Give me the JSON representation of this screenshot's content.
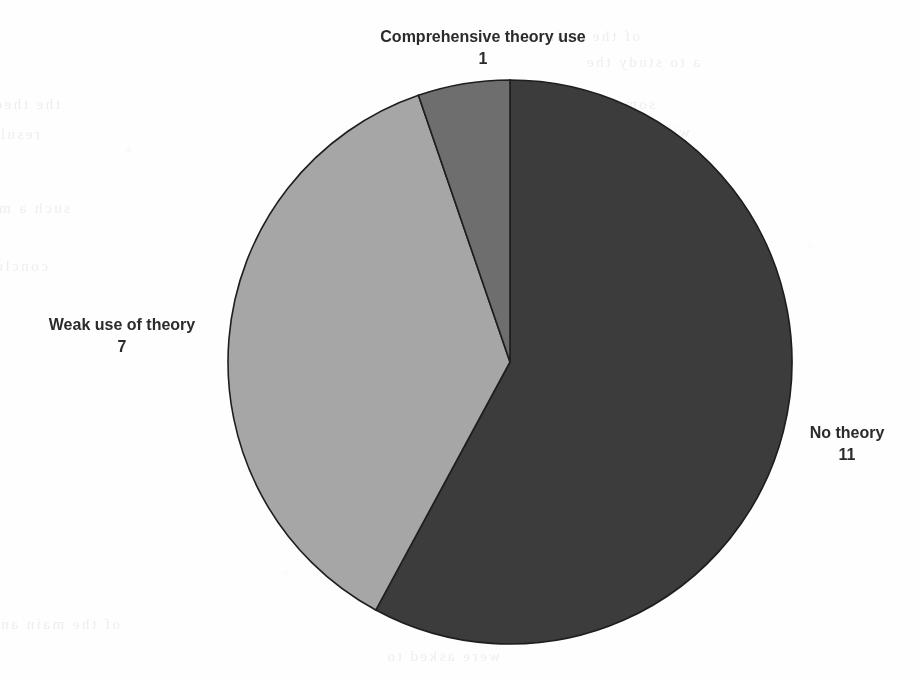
{
  "chart_data": {
    "type": "pie",
    "title": "",
    "categories": [
      "No theory",
      "Weak use of theory",
      "Comprehensive theory use"
    ],
    "values": [
      11,
      7,
      1
    ],
    "total": 19,
    "start_angle_deg": 0,
    "direction": "clockwise",
    "legend": "none",
    "grid": false,
    "data_labels": "category name and value, outside slices",
    "slices": [
      {
        "label": "No theory",
        "value": 11,
        "value_text": "11",
        "color": "#3c3c3c",
        "angle_deg": 208.4,
        "percent": 57.9
      },
      {
        "label": "Weak use of theory",
        "value": 7,
        "value_text": "7",
        "color": "#a6a6a6",
        "angle_deg": 132.6,
        "percent": 36.8
      },
      {
        "label": "Comprehensive theory use",
        "value": 1,
        "value_text": "1",
        "color": "#6e6e6e",
        "angle_deg": 18.9,
        "percent": 5.3
      }
    ]
  },
  "labels": {
    "comprehensive": {
      "name": "Comprehensive theory use",
      "value": "1"
    },
    "weak": {
      "name": "Weak use of theory",
      "value": "7"
    },
    "no_theory": {
      "name": "No theory",
      "value": "11"
    }
  },
  "colors": {
    "no_theory": "#3c3c3c",
    "weak": "#a6a6a6",
    "comprehensive": "#6e6e6e",
    "slice_border": "#1e1e1e",
    "label_text": "#2b2b2b",
    "page_background": "#fefefe"
  },
  "background_artifacts": {
    "description": "faint mirrored show-through text bleeding from the reverse side of the scanned page",
    "lines": [
      "of the main and",
      "a to study the",
      "some of which",
      "with a sample",
      "and the study",
      "were asked to",
      "in the second",
      "for each item",
      "analysis and",
      "reported that",
      "the theory of",
      "results of the",
      "such a model",
      "conclusion we"
    ]
  }
}
